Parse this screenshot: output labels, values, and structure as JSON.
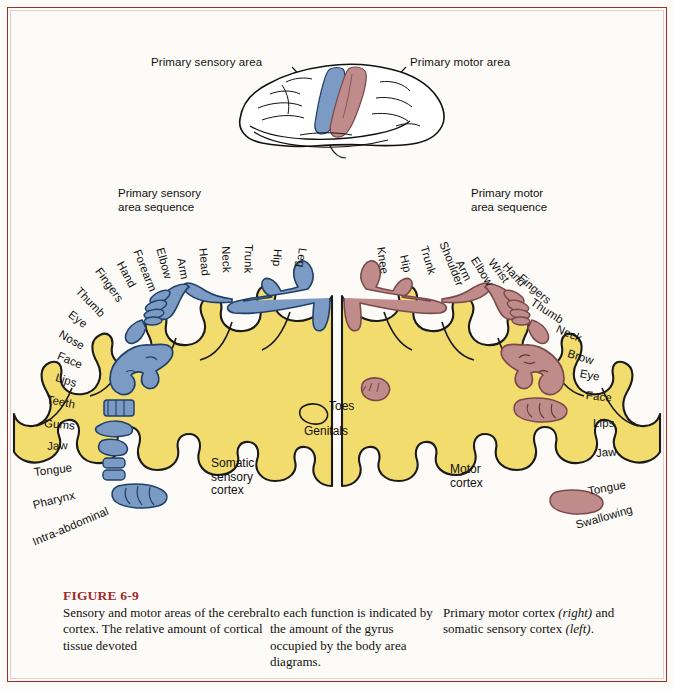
{
  "figure": {
    "number": "FIGURE 6-9",
    "title": "Sensory and motor areas of the cerebral cortex",
    "accent_color": "#9e2a2a",
    "background_color": "#fdfbf7"
  },
  "brain_inset": {
    "sensory_callout": "Primary sensory area",
    "motor_callout": "Primary motor area",
    "sensory_band_color": "#7b9bc4",
    "motor_band_color": "#c08b8b",
    "brain_fill": "#ffffff",
    "outline_color": "#111111"
  },
  "sensory_panel": {
    "heading_line1": "Primary sensory",
    "heading_line2": "area sequence",
    "cortex_label_line1": "Somatic",
    "cortex_label_line2": "sensory",
    "cortex_label_line3": "cortex",
    "inner_label": "Genitals",
    "body_color": "#7b9bc4",
    "cortex_color": "#f2dc6e",
    "sequence": [
      "Intra-abdominal",
      "Pharynx",
      "Tongue",
      "Jaw",
      "Gums",
      "Teeth",
      "Lips",
      "Face",
      "Nose",
      "Eye",
      "Thumb",
      "Fingers",
      "Hand",
      "Forearm",
      "Elbow",
      "Arm",
      "Head",
      "Neck",
      "Trunk",
      "Hip",
      "Leg"
    ]
  },
  "motor_panel": {
    "heading_line1": "Primary motor",
    "heading_line2": "area sequence",
    "cortex_label_line1": "Motor",
    "cortex_label_line2": "cortex",
    "inner_label": "Toes",
    "body_color": "#c08b8b",
    "cortex_color": "#f2dc6e",
    "sequence": [
      "Knee",
      "Hip",
      "Trunk",
      "Shoulder",
      "Arm",
      "Elbow",
      "Wrist",
      "Hand",
      "Fingers",
      "Thumb",
      "Neck",
      "Brow",
      "Eye",
      "Face",
      "Lips",
      "Jaw",
      "Tongue",
      "Swallowing"
    ]
  },
  "caption": {
    "column1": "Sensory and motor areas of the cerebral cortex. The relative amount of cortical tissue devoted",
    "column2": "to each function is indicated by the amount of the gyrus occupied by the body area diagrams.",
    "column3_part1": "Primary motor cortex ",
    "column3_italic1": "(right)",
    "column3_part2": " and somatic sensory cortex ",
    "column3_italic2": "(left)",
    "column3_part3": "."
  }
}
